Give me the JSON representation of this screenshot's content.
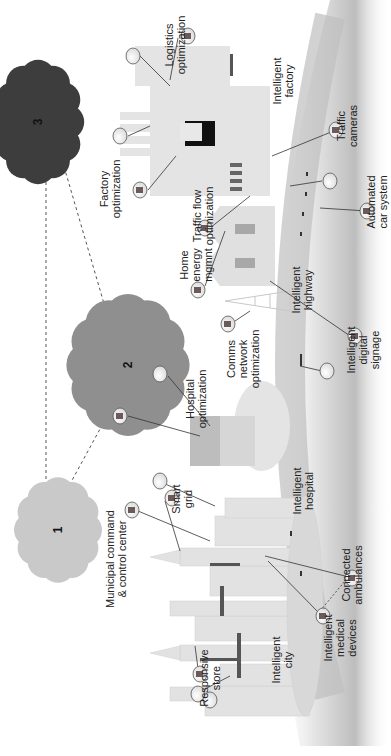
{
  "diagram": {
    "clouds": [
      {
        "id": "1",
        "label": "1",
        "color": "#c9c9c9"
      },
      {
        "id": "2",
        "label": "2",
        "color": "#8f8f8f"
      },
      {
        "id": "3",
        "label": "3",
        "color": "#3d3d3d"
      }
    ],
    "labels": {
      "logistics_optimization": "Logistics\noptimization",
      "factory_optimization": "Factory\noptimization",
      "intelligent_factory": "Intelligent\nfactory",
      "traffic_cameras": "Traffic\ncameras",
      "automated_car_system": "Automated\ncar system",
      "traffic_flow_optimization": "Traffic flow\noptimization",
      "home_energy_mgmnt": "Home\nenergy\nmgmnt",
      "intelligent_highway": "Intelligent\nhighway",
      "intelligent_digital_signage": "Intelligent\ndigital\nsignage",
      "comms_network_optimization": "Comms\nnetwork\noptimization",
      "hospital_optimization": "Hospital\noptimization",
      "intelligent_hospital": "Intelligent\nhospital",
      "smart_grid": "Smart\ngrid",
      "municipal_command": "Municipal command\n& control center",
      "connected_ambulances": "Connected\nambulances",
      "intelligent_city": "Intelligent\ncity",
      "intelligent_medical_devices": "Intelligent\nmedical\ndevices",
      "responsive_store": "Responsive\nstore"
    }
  }
}
